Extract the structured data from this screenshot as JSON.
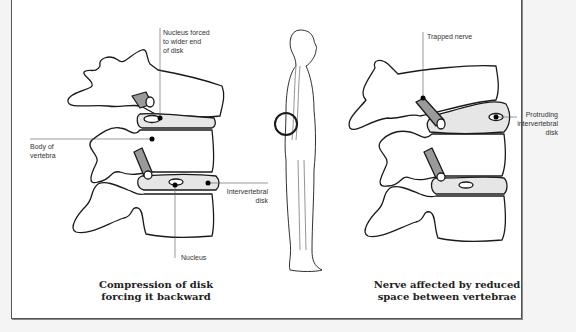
{
  "diagram": {
    "left_panel": {
      "caption_line1": "Compression of disk",
      "caption_line2": "forcing it backward",
      "labels": {
        "nucleus_forced_1": "Nucleus forced",
        "nucleus_forced_2": "to wider end",
        "nucleus_forced_3": "of disk",
        "body_1": "Body of",
        "body_2": "vertebra",
        "disk_1": "Intervertebral",
        "disk_2": "disk",
        "nucleus": "Nucleus"
      }
    },
    "center_panel": {
      "figure": "standing-human-side-view",
      "highlight": "lumbar-region-circle"
    },
    "right_panel": {
      "caption_line1": "Nerve affected by reduced",
      "caption_line2": "space between vertebrae",
      "labels": {
        "trapped": "Trapped nerve",
        "protruding_1": "Protruding",
        "protruding_2": "intervertebral",
        "protruding_3": "disk"
      }
    },
    "colors": {
      "outline": "#1a1a1a",
      "disk_fill": "#e6e6e6",
      "nerve_fill": "#9a9a9a",
      "background": "#ffffff"
    }
  }
}
